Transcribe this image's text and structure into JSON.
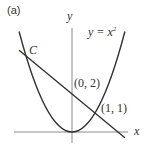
{
  "figure": {
    "panel_label": "(a)",
    "axes": {
      "x_label": "x",
      "y_label": "y"
    },
    "curve": {
      "label_lhs": "y = x",
      "label_exp": "2",
      "equation": "y = x^2"
    },
    "line": {
      "equation": "y = 2 - x"
    },
    "points": [
      {
        "name": "C",
        "label": "C",
        "x": -2,
        "y": 4
      },
      {
        "name": "y-intercept",
        "label": "(0, 2)",
        "x": 0,
        "y": 2
      },
      {
        "name": "intersection",
        "label": "(1, 1)",
        "x": 1,
        "y": 1
      }
    ],
    "colors": {
      "curve": "#333333",
      "axis": "#888888",
      "text": "#333333"
    }
  }
}
